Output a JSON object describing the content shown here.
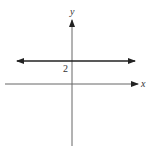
{
  "diagram": {
    "type": "coordinate-plane",
    "axes": {
      "x_label": "x",
      "y_label": "y"
    },
    "line": {
      "equation": "y = 2",
      "kind": "horizontal",
      "y_intercept_label": "2",
      "arrows": "both-ends"
    },
    "colors": {
      "axis": "#555555",
      "line": "#222222",
      "background": "#ffffff"
    }
  }
}
